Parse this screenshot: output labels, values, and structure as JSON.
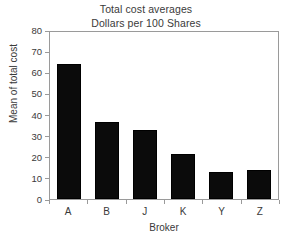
{
  "chart_data": {
    "type": "bar",
    "title": "Total cost averages",
    "subtitle": "Dollars per 100 Shares",
    "xlabel": "Broker",
    "ylabel": "Mean of total cost",
    "categories": [
      "A",
      "B",
      "J",
      "K",
      "Y",
      "Z"
    ],
    "values": [
      64,
      36.5,
      32.5,
      21.5,
      13,
      13.8
    ],
    "ylim": [
      0,
      80
    ],
    "ytick_step": 10,
    "yticks": [
      0,
      10,
      20,
      30,
      40,
      50,
      60,
      70,
      80
    ],
    "ytick_labels": [
      "0",
      "10",
      "20",
      "30",
      "40",
      "50",
      "60",
      "70",
      "80"
    ],
    "grid": false,
    "legend": false,
    "bar_color": "#0b0b0b",
    "frame_color": "#9a9a9a",
    "background_color": "#ffffff",
    "text_color": "#3a3a3a"
  }
}
